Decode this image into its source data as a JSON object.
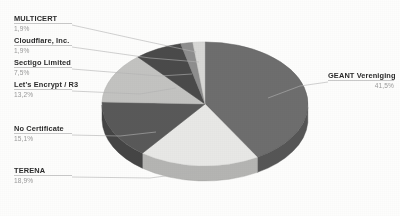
{
  "chart_data": {
    "type": "pie",
    "title": "",
    "subtitle": "",
    "xlabel": "",
    "ylabel": "",
    "legend_position": "callout-labels",
    "grid": false,
    "three_d": true,
    "decimal_separator": ",",
    "categories": [
      "GEANT Vereniging",
      "TERENA",
      "No Certificate",
      "Let's Encrypt / R3",
      "Sectigo Limited",
      "Cloudflare, Inc.",
      "MULTICERT"
    ],
    "values": [
      41.5,
      18.9,
      15.1,
      13.2,
      7.5,
      1.9,
      1.9
    ],
    "value_labels": [
      "41,5%",
      "18,9%",
      "15,1%",
      "13,2%",
      "7,5%",
      "1,9%",
      "1,9%"
    ],
    "colors": [
      "#6e6e6e",
      "#e8e8e6",
      "#595959",
      "#c3c3c1",
      "#4a4a4a",
      "#8e8e8e",
      "#d8d8d6"
    ],
    "slices": [
      {
        "name": "GEANT Vereniging",
        "value": 41.5,
        "label": "41,5%",
        "color": "#6e6e6e"
      },
      {
        "name": "TERENA",
        "value": 18.9,
        "label": "18,9%",
        "color": "#e8e8e6"
      },
      {
        "name": "No Certificate",
        "value": 15.1,
        "label": "15,1%",
        "color": "#595959"
      },
      {
        "name": "Let's Encrypt / R3",
        "value": 13.2,
        "label": "13,2%",
        "color": "#c3c3c1"
      },
      {
        "name": "Sectigo Limited",
        "value": 7.5,
        "label": "7,5%",
        "color": "#4a4a4a"
      },
      {
        "name": "Cloudflare, Inc.",
        "value": 1.9,
        "label": "1,9%",
        "color": "#8e8e8e"
      },
      {
        "name": "MULTICERT",
        "value": 1.9,
        "label": "1,9%",
        "color": "#d8d8d6"
      }
    ]
  },
  "labels": {
    "multicert": {
      "name": "MULTICERT",
      "pct": "1,9%"
    },
    "cloudflare": {
      "name": "Cloudflare, Inc.",
      "pct": "1,9%"
    },
    "sectigo": {
      "name": "Sectigo Limited",
      "pct": "7,5%"
    },
    "letsencrypt": {
      "name": "Let's Encrypt / R3",
      "pct": "13,2%"
    },
    "nocert": {
      "name": "No Certificate",
      "pct": "15,1%"
    },
    "terena": {
      "name": "TERENA",
      "pct": "18,9%"
    },
    "geant": {
      "name": "GEANT Vereniging",
      "pct": "41,5%"
    }
  }
}
